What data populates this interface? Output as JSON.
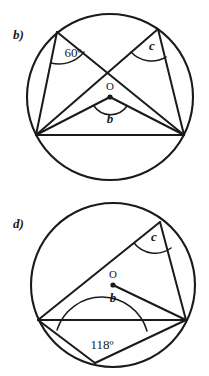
{
  "figure": {
    "type": "geometry-diagram",
    "background_color": "#ffffff",
    "ink_color": "#1a1a1a",
    "panels": [
      {
        "id": "panel-b",
        "part_label": "b)",
        "shape": "circle",
        "circle": {
          "cx": 110,
          "cy": 97,
          "r": 83
        },
        "center_point_label": "O",
        "labels": {
          "known_angle": "60º",
          "central_angle": "b",
          "inscribed_angle": "c"
        },
        "vertices": [
          {
            "name": "top-left-vertex",
            "x": 57,
            "y": 32
          },
          {
            "name": "top-right-vertex",
            "x": 158,
            "y": 29
          },
          {
            "name": "bottom-left-vertex",
            "x": 36,
            "y": 135
          },
          {
            "name": "bottom-right-vertex",
            "x": 184,
            "y": 135
          }
        ],
        "chords": [
          {
            "name": "chord-topleft-to-bottomleft",
            "from": "top-left-vertex",
            "to": "bottom-left-vertex"
          },
          {
            "name": "chord-topleft-to-bottomright",
            "from": "top-left-vertex",
            "to": "bottom-right-vertex"
          },
          {
            "name": "chord-topright-to-bottomleft",
            "from": "top-right-vertex",
            "to": "bottom-left-vertex"
          },
          {
            "name": "chord-topright-to-bottomright",
            "from": "top-right-vertex",
            "to": "bottom-right-vertex"
          },
          {
            "name": "chord-bottomleft-to-bottomright",
            "from": "bottom-left-vertex",
            "to": "bottom-right-vertex"
          },
          {
            "name": "radius-center-to-bottomleft",
            "from": "center",
            "to": "bottom-left-vertex"
          },
          {
            "name": "radius-center-to-bottomright",
            "from": "center",
            "to": "bottom-right-vertex"
          }
        ]
      },
      {
        "id": "panel-d",
        "part_label": "d)",
        "shape": "circle",
        "circle": {
          "cx": 113,
          "cy": 285,
          "r": 82
        },
        "center_point_label": "O",
        "labels": {
          "known_angle": "118º",
          "central_angle": "b",
          "inscribed_angle": "c"
        },
        "vertices": [
          {
            "name": "top-right-vertex",
            "x": 160,
            "y": 222
          },
          {
            "name": "left-vertex",
            "x": 38,
            "y": 320
          },
          {
            "name": "right-vertex",
            "x": 186,
            "y": 320
          },
          {
            "name": "bottom-vertex",
            "x": 95,
            "y": 363
          }
        ],
        "chords": [
          {
            "name": "chord-topright-to-left",
            "from": "top-right-vertex",
            "to": "left-vertex"
          },
          {
            "name": "chord-topright-to-right",
            "from": "top-right-vertex",
            "to": "right-vertex"
          },
          {
            "name": "chord-left-to-right",
            "from": "left-vertex",
            "to": "right-vertex"
          },
          {
            "name": "chord-left-to-bottom",
            "from": "left-vertex",
            "to": "bottom-vertex"
          },
          {
            "name": "chord-bottom-to-right",
            "from": "bottom-vertex",
            "to": "right-vertex"
          },
          {
            "name": "radius-center-to-right",
            "from": "center",
            "to": "right-vertex"
          }
        ]
      }
    ]
  }
}
